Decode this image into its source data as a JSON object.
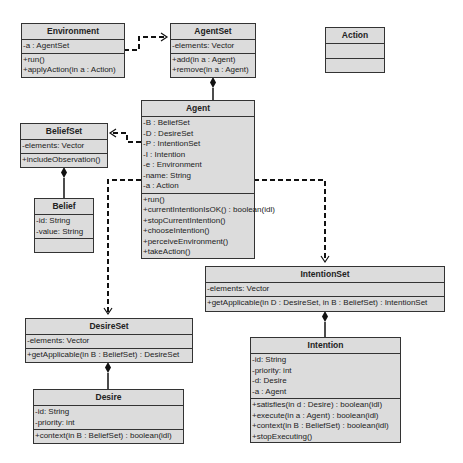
{
  "diagram": {
    "type": "UML class diagram",
    "classes": {
      "environment": {
        "name": "Environment",
        "attributes": [
          "-a : AgentSet"
        ],
        "operations": [
          "+run()",
          "+applyAction(in a : Action)"
        ]
      },
      "agentset": {
        "name": "AgentSet",
        "attributes": [
          "-elements: Vector"
        ],
        "operations": [
          "+add(in a : Agent)",
          "+remove(in a : Agent)"
        ]
      },
      "action": {
        "name": "Action",
        "attributes": [],
        "operations": []
      },
      "agent": {
        "name": "Agent",
        "attributes": [
          "-B : BeliefSet",
          "-D : DesireSet",
          "-P : IntentionSet",
          "-I : Intention",
          "-e : Environment",
          "-name: String",
          "-a : Action"
        ],
        "operations": [
          "+run()",
          "+currentIntentionIsOK() : boolean(idl)",
          "+stopCurrentIntention()",
          "+chooseIntention()",
          "+perceiveEnvironment()",
          "+takeAction()"
        ]
      },
      "beliefset": {
        "name": "BeliefSet",
        "attributes": [
          "-elements: Vector"
        ],
        "operations": [
          "+includeObservation()"
        ]
      },
      "belief": {
        "name": "Belief",
        "attributes": [
          "-id: String",
          "-value: String"
        ],
        "operations": []
      },
      "intentionset": {
        "name": "IntentionSet",
        "attributes": [
          "-elements: Vector"
        ],
        "operations": [
          "+getApplicable(in D : DesireSet, in B : BeliefSet) : IntentionSet"
        ]
      },
      "desireset": {
        "name": "DesireSet",
        "attributes": [
          "-elements: Vector"
        ],
        "operations": [
          "+getApplicable(in B : BeliefSet) : DesireSet"
        ]
      },
      "desire": {
        "name": "Desire",
        "attributes": [
          "-id: String",
          "-priority: int"
        ],
        "operations": [
          "+context(in B : BeliefSet) : boolean(idl)"
        ]
      },
      "intention": {
        "name": "Intention",
        "attributes": [
          "-id: String",
          "-priority: int",
          "-d: Desire",
          "-a : Agent"
        ],
        "operations": [
          "+satisfies(in d : Desire) : boolean(idl)",
          "+execute(in a : Agent) : boolean(idl)",
          "+context(in B : BeliefSet) : boolean(idl)",
          "+stopExecuting()"
        ]
      }
    },
    "relations": [
      {
        "type": "dependency",
        "from": "Environment",
        "to": "AgentSet"
      },
      {
        "type": "composition",
        "whole": "AgentSet",
        "part": "Agent"
      },
      {
        "type": "dependency",
        "from": "Agent",
        "to": "BeliefSet"
      },
      {
        "type": "dependency",
        "from": "Agent",
        "to": "DesireSet"
      },
      {
        "type": "dependency",
        "from": "Agent",
        "to": "IntentionSet"
      },
      {
        "type": "composition",
        "whole": "BeliefSet",
        "part": "Belief"
      },
      {
        "type": "composition",
        "whole": "DesireSet",
        "part": "Desire"
      },
      {
        "type": "composition",
        "whole": "IntentionSet",
        "part": "Intention"
      }
    ],
    "colors": {
      "box_fill": "#dcdcdc",
      "border": "#333333",
      "line": "#111111"
    }
  }
}
